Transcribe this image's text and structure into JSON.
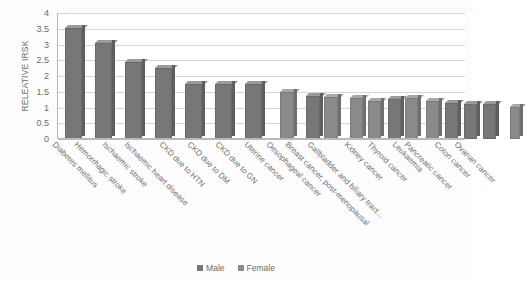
{
  "chart_data": {
    "type": "bar",
    "title": "",
    "xlabel": "",
    "ylabel": "RELEATIVE IRSK",
    "ylim": [
      0,
      4
    ],
    "ytick_step": 0.5,
    "ytick_labels": [
      "4",
      "3.5",
      "3",
      "2.5",
      "2",
      "1.5",
      "1",
      "0.5",
      "0"
    ],
    "grid": true,
    "legend_position": "bottom",
    "categories": [
      "Diabetes mellitus",
      "Hemorrhagic stroke",
      "Ischaemic stroke",
      "Ischaemic heart disease",
      "CKD due to HTN",
      "CKD due to DM",
      "CKD due to GN",
      "Uterine cancer",
      "Oesophageal cancer",
      "Breast cancer, post-menopausal",
      "Gallbladder and biliary tract...",
      "Kidney cancer",
      "Thyroid cancer",
      "Leukaemia",
      "Pancreatic cancer",
      "Colon cancer",
      "Ovarian cancer"
    ],
    "series": [
      {
        "name": "Male",
        "values": [
          3.62,
          3.15,
          2.55,
          2.35,
          1.85,
          1.85,
          1.85,
          null,
          1.45,
          null,
          null,
          1.35,
          1.25,
          1.2,
          1.2,
          1.1,
          null
        ]
      },
      {
        "name": "Female",
        "values": [
          null,
          null,
          null,
          null,
          null,
          null,
          null,
          1.58,
          1.42,
          1.4,
          1.3,
          1.4,
          1.3,
          1.25,
          1.2,
          1.15,
          1.1
        ]
      }
    ],
    "legend": [
      "Male",
      "Female"
    ],
    "colors": {
      "male": "#777777",
      "female": "#8a8a8a",
      "gridline": "#d6d6d6",
      "axis": "#b9b9b9",
      "text": "#6b6b6b"
    },
    "bar_layout": [
      {
        "label": "Diabetes mellitus",
        "x": 7,
        "w": 20,
        "v": 3.62,
        "series": "male"
      },
      {
        "label": "Hemorrhagic stroke",
        "x": 37,
        "w": 20,
        "v": 3.15,
        "series": "male"
      },
      {
        "label": "Ischaemic stroke",
        "x": 67,
        "w": 20,
        "v": 2.55,
        "series": "male"
      },
      {
        "label": "Ischaemic heart disease",
        "x": 97,
        "w": 20,
        "v": 2.35,
        "series": "male"
      },
      {
        "label": "CKD due to HTN",
        "x": 127,
        "w": 20,
        "v": 1.85,
        "series": "male"
      },
      {
        "label": "CKD due to DM",
        "x": 157,
        "w": 20,
        "v": 1.85,
        "series": "male"
      },
      {
        "label": "CKD due to GN",
        "x": 187,
        "w": 20,
        "v": 1.85,
        "series": "male"
      },
      {
        "label": "Uterine cancer",
        "x": 222,
        "w": 17,
        "v": 1.58,
        "series": "female"
      },
      {
        "label": "Oesophageal cancer male",
        "x": 248,
        "w": 17,
        "v": 1.45,
        "series": "male"
      },
      {
        "label": "Oesophageal cancer female",
        "x": 266,
        "w": 17,
        "v": 1.42,
        "series": "female"
      },
      {
        "label": "Breast cancer, post-menopausal",
        "x": 292,
        "w": 16,
        "v": 1.4,
        "series": "female"
      },
      {
        "label": "Gallbladder and biliary tract",
        "x": 310,
        "w": 16,
        "v": 1.3,
        "series": "female"
      },
      {
        "label": "Kidney cancer male",
        "x": 330,
        "w": 16,
        "v": 1.35,
        "series": "male"
      },
      {
        "label": "Kidney cancer female",
        "x": 347,
        "w": 16,
        "v": 1.4,
        "series": "female"
      },
      {
        "label": "Thyroid cancer",
        "x": 368,
        "w": 16,
        "v": 1.3,
        "series": "female"
      },
      {
        "label": "Leukaemia",
        "x": 387,
        "w": 16,
        "v": 1.25,
        "series": "male"
      },
      {
        "label": "Pancreatic cancer",
        "x": 406,
        "w": 16,
        "v": 1.2,
        "series": "male"
      },
      {
        "label": "Colon cancer",
        "x": 425,
        "w": 16,
        "v": 1.22,
        "series": "male"
      },
      {
        "label": "Ovarian cancer",
        "x": 452,
        "w": 13,
        "v": 1.1,
        "series": "female"
      }
    ],
    "label_positions": [
      {
        "text": "Diabetes mellitus",
        "x": 0
      },
      {
        "text": "Hemorrhagic stroke",
        "x": 22
      },
      {
        "text": "Ischaemic stroke",
        "x": 50
      },
      {
        "text": "Ischaemic heart disease",
        "x": 72
      },
      {
        "text": "CKD due to HTN",
        "x": 107
      },
      {
        "text": "CKD due to DM",
        "x": 135
      },
      {
        "text": "CKD due to GN",
        "x": 163
      },
      {
        "text": "Uterine cancer",
        "x": 192
      },
      {
        "text": "Oesophageal cancer",
        "x": 214
      },
      {
        "text": "Breast cancer, post-menopausal",
        "x": 233
      },
      {
        "text": "Gallbladder and biliary tract...",
        "x": 255
      },
      {
        "text": "Kidney cancer",
        "x": 292
      },
      {
        "text": "Thyroid cancer",
        "x": 315
      },
      {
        "text": "Leukaemia",
        "x": 340
      },
      {
        "text": "Pancreatic cancer",
        "x": 352
      },
      {
        "text": "Colon cancer",
        "x": 382
      },
      {
        "text": "Ovarian cancer",
        "x": 402
      }
    ]
  }
}
